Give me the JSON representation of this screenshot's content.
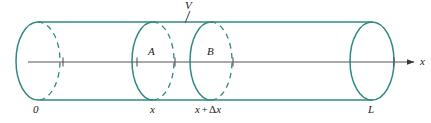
{
  "figure": {
    "type": "cylinder-cross-section-diagram",
    "colors": {
      "cylinder_outline": "#2f8a82",
      "axis_line": "#55555a",
      "label_text": "#1a1a1a",
      "background": "#ffffff"
    },
    "labels": {
      "volume": "V",
      "cross_section_a": "A",
      "cross_section_b": "B",
      "origin": "0",
      "position_x": "x",
      "position_x_plus_dx_x": "x",
      "position_x_plus_dx_op": "+",
      "position_x_plus_dx_delta": "Δ",
      "position_x_plus_dx_var": "x",
      "length": "L",
      "axis": "x"
    },
    "geometry": {
      "cylinder_top_y": 22,
      "cylinder_bottom_y": 100,
      "left_end_center_x": 38,
      "disc_a_center_x": 153,
      "disc_b_center_x": 211,
      "right_end_center_x": 372,
      "ellipse_rx": 22,
      "ellipse_ry": 39,
      "axis_y": 62,
      "axis_start_x": 28,
      "axis_end_x": 420,
      "tick_positions": [
        63,
        137,
        175,
        234,
        395
      ]
    }
  }
}
